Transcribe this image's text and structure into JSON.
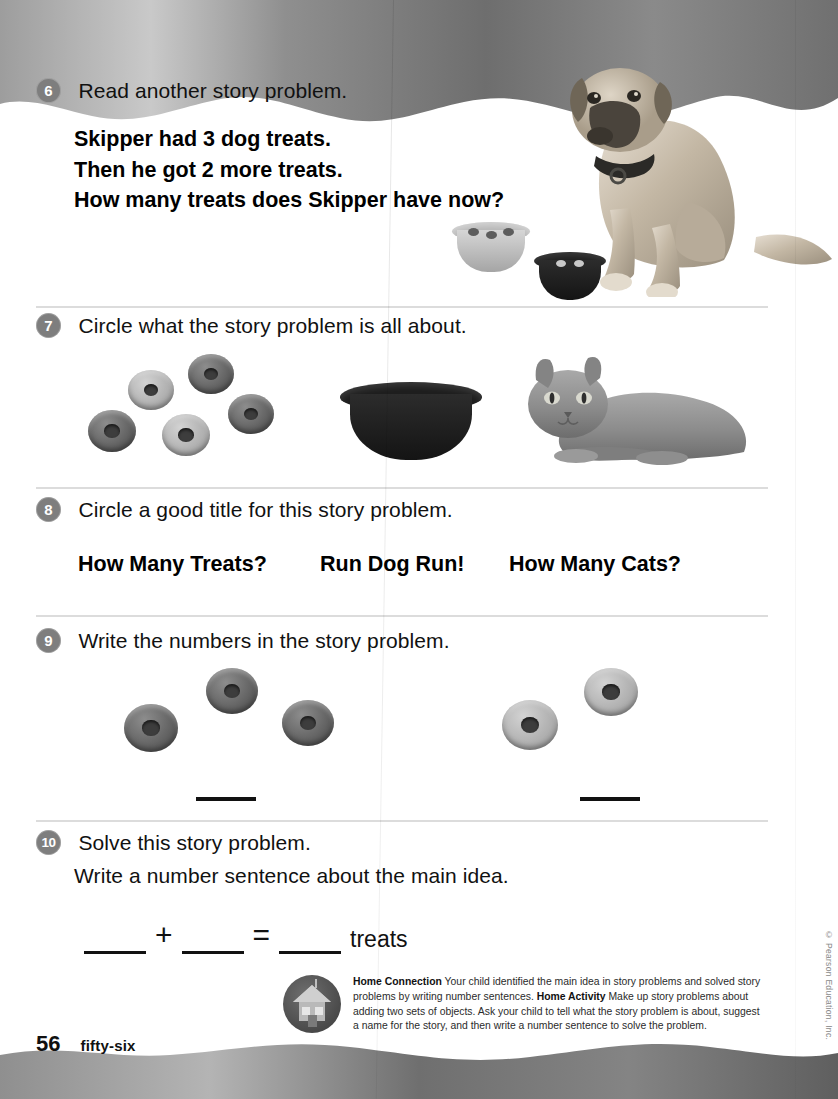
{
  "page": {
    "number": "56",
    "number_word": "fifty-six",
    "copyright": "© Pearson Education, Inc."
  },
  "items": [
    {
      "number": "6",
      "prompt": "Read another story problem.",
      "story_lines": [
        "Skipper had 3 dog treats.",
        "Then he got 2 more treats.",
        "How many treats does Skipper have now?"
      ],
      "art": [
        "dog-photo",
        "light-bowl-with-3-treats",
        "dark-bowl-with-2-treats"
      ]
    },
    {
      "number": "7",
      "prompt": "Circle what the story problem is all about.",
      "choices": [
        "five-treats-group",
        "empty-dark-bowl",
        "grey-cat-photo"
      ]
    },
    {
      "number": "8",
      "prompt": "Circle a good title for this story problem.",
      "titles": [
        "How Many Treats?",
        "Run Dog Run!",
        "How Many Cats?"
      ]
    },
    {
      "number": "9",
      "prompt": "Write the numbers in the story problem.",
      "groups": [
        {
          "count": 3,
          "blank": ""
        },
        {
          "count": 2,
          "blank": ""
        }
      ]
    },
    {
      "number": "10",
      "prompt_lines": [
        "Solve this story problem.",
        "Write a number sentence about the main idea."
      ],
      "equation": {
        "addend1": "",
        "plus": "+",
        "addend2": "",
        "equals": "=",
        "sum": "",
        "unit": "treats"
      }
    }
  ],
  "home_connection": {
    "heading": "Home Connection",
    "body1": " Your child identified the main idea in story problems and solved story problems by writing number sentences. ",
    "activity_heading": "Home Activity",
    "body2": " Make up story problems about adding two sets of objects. Ask your child to tell what the story problem is about, suggest a name for the story, and then write a number sentence to solve the problem."
  },
  "colors": {
    "number_badge": "#7e7e7e",
    "rule": "#dcdcdc",
    "band": "#8c8c8c",
    "ink": "#111111"
  }
}
